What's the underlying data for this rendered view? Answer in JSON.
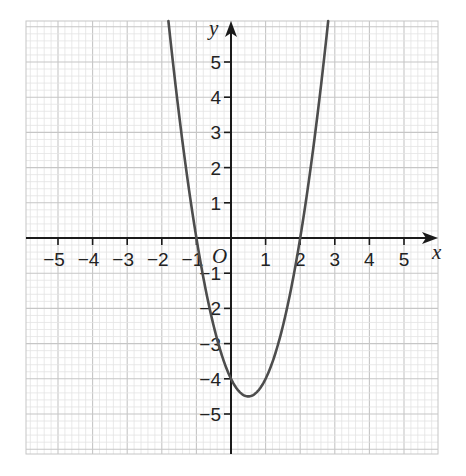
{
  "chart_data": {
    "type": "line",
    "title": "",
    "function": "y = 2x^2 - 2x - 4",
    "coefficients": {
      "a": 2,
      "b": -2,
      "c": -4
    },
    "xlabel": "x",
    "ylabel": "y",
    "origin_label": "O",
    "xlim": [
      -5.9,
      6.0
    ],
    "ylim": [
      -6.2,
      6.0
    ],
    "x_ticks": [
      -5,
      -4,
      -3,
      -2,
      -1,
      1,
      2,
      3,
      4,
      5
    ],
    "x_tick_labels": [
      "−5",
      "−4",
      "−3",
      "−2",
      "−1",
      "1",
      "2",
      "3",
      "4",
      "5"
    ],
    "y_ticks": [
      -5,
      -4,
      -3,
      -2,
      -1,
      1,
      2,
      3,
      4,
      5
    ],
    "y_tick_labels": [
      "−5",
      "−4",
      "−3",
      "−2",
      "−1",
      "1",
      "2",
      "3",
      "4",
      "5"
    ],
    "grid": {
      "on": true,
      "minor_divisions_per_unit": 5
    },
    "key_points": {
      "roots": [
        [
          -1,
          0
        ],
        [
          2,
          0
        ]
      ],
      "y_intercept": [
        0,
        -4
      ],
      "vertex": [
        0.5,
        -4.5
      ]
    },
    "series": [
      {
        "name": "y = 2x^2 - 2x - 4",
        "x": [
          -1.83,
          -1.5,
          -1,
          -0.5,
          0,
          0.5,
          1,
          1.5,
          2,
          2.5,
          2.83
        ],
        "y": [
          6.35,
          3.5,
          0,
          -2.5,
          -4,
          -4.5,
          -4,
          -2.5,
          0,
          3.5,
          6.35
        ]
      }
    ]
  },
  "colors": {
    "background": "#ffffff",
    "minor_grid": "#e3e3e3",
    "major_grid": "#c6c6c6",
    "axis": "#1a1a1a",
    "curve": "#4d4d4d",
    "text": "#222222"
  },
  "layout": {
    "origin_px": [
      231,
      238
    ],
    "unit_x_px": 34.6,
    "unit_y_px": 35.2,
    "grid_box": [
      26,
      21,
      438,
      454
    ]
  }
}
